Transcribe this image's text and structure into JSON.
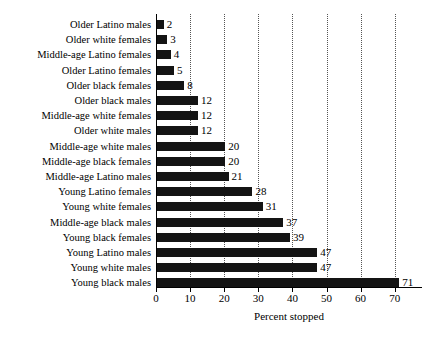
{
  "chart_data": {
    "type": "bar",
    "orientation": "horizontal",
    "title": "",
    "subtitle": "",
    "xlabel": "Percent stopped",
    "ylabel": "",
    "xlim": [
      0,
      78
    ],
    "ylim": null,
    "grid": true,
    "grid_axis": "x",
    "grid_style": "dotted",
    "legend": false,
    "legend_position": "none",
    "bar_color": "#141414",
    "text_color": "#000000",
    "background_color": "#ffffff",
    "xticks": [
      0,
      10,
      20,
      30,
      40,
      50,
      60,
      70
    ],
    "xtick_labels": [
      "0",
      "10",
      "20",
      "30",
      "40",
      "50",
      "60",
      "70"
    ],
    "data_labels_shown": true,
    "categories": [
      "Older Latino males",
      "Older white females",
      "Middle-age Latino females",
      "Older Latino females",
      "Older black females",
      "Older black males",
      "Middle-age white females",
      "Older white males",
      "Middle-age white males",
      "Middle-age black females",
      "Middle-age Latino males",
      "Young Latino females",
      "Young white females",
      "Middle-age black males",
      "Young black females",
      "Young Latino males",
      "Young white males",
      "Young black males"
    ],
    "values": [
      2,
      3,
      4,
      5,
      8,
      12,
      12,
      12,
      20,
      20,
      21,
      28,
      31,
      37,
      39,
      47,
      47,
      71
    ],
    "value_labels": [
      "2",
      "3",
      "4",
      "5",
      "8",
      "12",
      "12",
      "12",
      "20",
      "20",
      "21",
      "28",
      "31",
      "37",
      "39",
      "47",
      "47",
      "71"
    ]
  }
}
